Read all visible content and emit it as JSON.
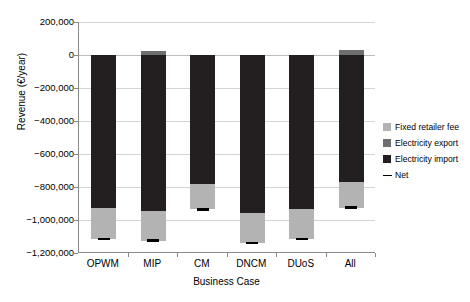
{
  "chart_data": {
    "type": "bar",
    "title": "",
    "subtitle": "",
    "xlabel": "Business Case",
    "ylabel": "Revenue (€/year)",
    "categories": [
      "OPWM",
      "MIP",
      "CM",
      "DNCM",
      "DUoS",
      "All"
    ],
    "ylim": [
      -1200000,
      200000
    ],
    "ytick_labels": [
      "200,000",
      "0",
      "−200,000",
      "−400,000",
      "−600,000",
      "−800,000",
      "−1,000,000",
      "−1,200,000"
    ],
    "ytick_values": [
      200000,
      0,
      -200000,
      -400000,
      -600000,
      -800000,
      -1000000,
      -1200000
    ],
    "grid": true,
    "stacked": true,
    "legend_position": "right",
    "series": [
      {
        "name": "Electricity import",
        "color": "#231f20",
        "values": [
          -930000,
          -945000,
          -780000,
          -955000,
          -935000,
          -770000
        ]
      },
      {
        "name": "Fixed retailer fee",
        "color": "#b3b3b3",
        "values": [
          -185000,
          -180000,
          -155000,
          -185000,
          -180000,
          -155000
        ]
      },
      {
        "name": "Electricity export",
        "color": "#6f6f6f",
        "values": [
          0,
          25000,
          0,
          0,
          0,
          30000
        ]
      }
    ],
    "net": {
      "name": "Net",
      "color": "#000000",
      "values": [
        -1115000,
        -1125000,
        -935000,
        -1140000,
        -1115000,
        -925000
      ]
    }
  },
  "legend": {
    "items": [
      {
        "label": "Fixed retailer fee",
        "swatch": "fee"
      },
      {
        "label": "Electricity export",
        "swatch": "export"
      },
      {
        "label": "Electricity import",
        "swatch": "import"
      },
      {
        "label": "Net",
        "swatch": "net"
      }
    ]
  }
}
